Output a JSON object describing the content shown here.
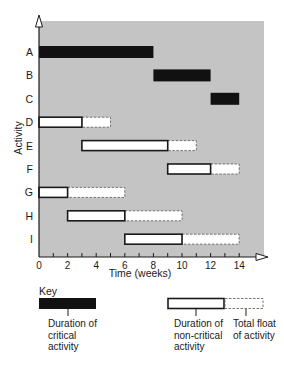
{
  "chart_data": {
    "type": "gantt",
    "title": "",
    "xlabel": "Time (weeks)",
    "ylabel": "Activity",
    "xlim": [
      0,
      15.5
    ],
    "xticks": [
      0,
      2,
      4,
      6,
      8,
      10,
      12,
      14
    ],
    "minor_tick_step": 1,
    "categories": [
      "A",
      "B",
      "C",
      "D",
      "E",
      "F",
      "G",
      "H",
      "I"
    ],
    "activities": [
      {
        "name": "A",
        "start": 0,
        "end": 8,
        "float_end": 8,
        "critical": true
      },
      {
        "name": "B",
        "start": 8,
        "end": 12,
        "float_end": 12,
        "critical": true
      },
      {
        "name": "C",
        "start": 12,
        "end": 14,
        "float_end": 14,
        "critical": true
      },
      {
        "name": "D",
        "start": 0,
        "end": 3,
        "float_end": 5,
        "critical": false
      },
      {
        "name": "E",
        "start": 3,
        "end": 9,
        "float_end": 11,
        "critical": false
      },
      {
        "name": "F",
        "start": 9,
        "end": 12,
        "float_end": 14,
        "critical": false
      },
      {
        "name": "G",
        "start": 0,
        "end": 2,
        "float_end": 6,
        "critical": false
      },
      {
        "name": "H",
        "start": 2,
        "end": 6,
        "float_end": 10,
        "critical": false
      },
      {
        "name": "I",
        "start": 6,
        "end": 10,
        "float_end": 14,
        "critical": false
      }
    ],
    "legend": [
      {
        "label": "Duration of critical activity",
        "style": "solid-black"
      },
      {
        "label": "Duration of non-critical activity",
        "style": "white-outlined"
      },
      {
        "label": "Total float of activity",
        "style": "dashed-outline"
      }
    ],
    "colors": {
      "plot_background": "#c4c4c4",
      "critical": "#111111",
      "noncritical_fill": "#ffffff",
      "outline": "#1a1a1a",
      "float_outline": "#666666"
    }
  },
  "key": {
    "title": "Key",
    "critical_line1": "Duration of",
    "critical_line2": "critical",
    "critical_line3": "activity",
    "noncritical_line1": "Duration of",
    "noncritical_line2": "non-critical",
    "noncritical_line3": "activity",
    "float_line1": "Total float",
    "float_line2": "of activity"
  }
}
